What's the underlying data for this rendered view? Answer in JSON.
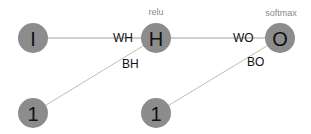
{
  "nodes": {
    "input": "I",
    "hidden": "H",
    "output": "O",
    "bias_hidden": "1",
    "bias_output": "1"
  },
  "activations": {
    "hidden": "relu",
    "output": "softmax"
  },
  "edges": {
    "wh": "WH",
    "bh": "BH",
    "wo": "WO",
    "bo": "BO"
  },
  "colors": {
    "node_fill": "#8c8c8c",
    "edge": "#bdbdbd",
    "background": "#ffffff"
  }
}
